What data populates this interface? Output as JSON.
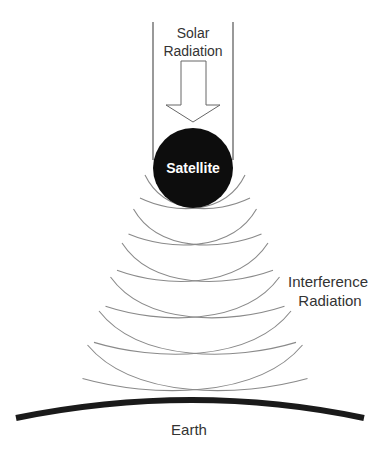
{
  "diagram": {
    "labels": {
      "solar_line1": "Solar",
      "solar_line2": "Radiation",
      "satellite": "Satellite",
      "interference_line1": "Interference",
      "interference_line2": "Radiation",
      "earth": "Earth"
    },
    "colors": {
      "background": "#ffffff",
      "satellite_fill": "#0d0d0d",
      "satellite_text": "#ffffff",
      "wave_stroke": "#8a8a8a",
      "outline_stroke": "#555555",
      "earth_stroke": "#1a1a1a",
      "text": "#333333"
    },
    "wavefront_count": 6
  }
}
